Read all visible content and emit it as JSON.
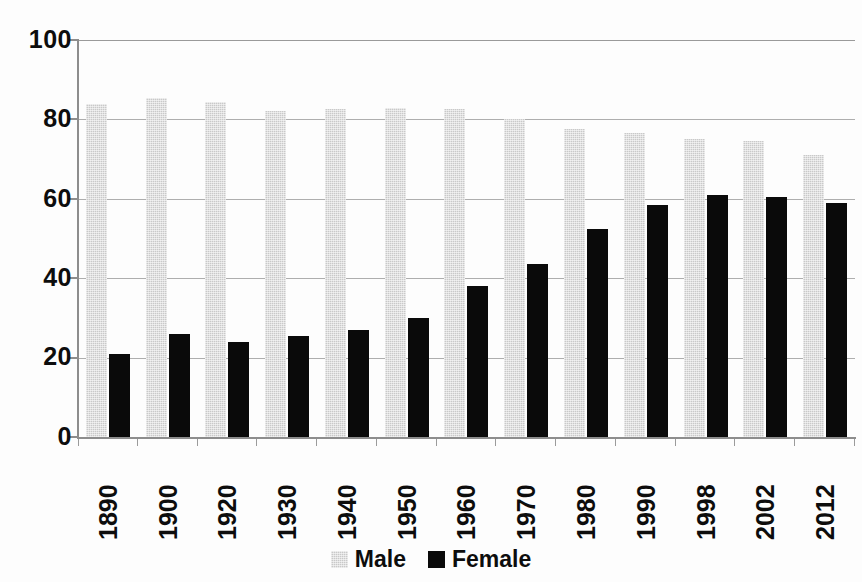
{
  "chart_data": {
    "type": "bar",
    "title": "",
    "subtitle": "",
    "xlabel": "",
    "ylabel": "",
    "ylim": [
      0,
      100
    ],
    "yticks": [
      0,
      20,
      40,
      60,
      80,
      100
    ],
    "grid": true,
    "legend_position": "bottom-center",
    "categories": [
      "1890",
      "1900",
      "1920",
      "1930",
      "1940",
      "1950",
      "1960",
      "1970",
      "1980",
      "1990",
      "1998",
      "2002",
      "2012"
    ],
    "series": [
      {
        "name": "Male",
        "color": "#c9c9c9",
        "values": [
          84,
          85.5,
          84.5,
          82,
          82.5,
          83,
          82.5,
          80,
          77.5,
          76.5,
          75,
          74.5,
          71
        ]
      },
      {
        "name": "Female",
        "color": "#0a0a0a",
        "values": [
          21,
          26,
          24,
          25.5,
          27,
          30,
          38,
          43.5,
          52.5,
          58.5,
          61,
          60.5,
          59
        ]
      }
    ]
  },
  "axis": {
    "y_tick_labels": [
      "100",
      "80",
      "60",
      "40",
      "20",
      "0"
    ],
    "x_tick_labels": [
      "1890",
      "1900",
      "1920",
      "1930",
      "1940",
      "1950",
      "1960",
      "1970",
      "1980",
      "1990",
      "1998",
      "2002",
      "2012"
    ]
  },
  "legend": {
    "items": [
      {
        "label": "Male",
        "swatch": "male-swatch"
      },
      {
        "label": "Female",
        "swatch": "female-swatch"
      }
    ]
  }
}
